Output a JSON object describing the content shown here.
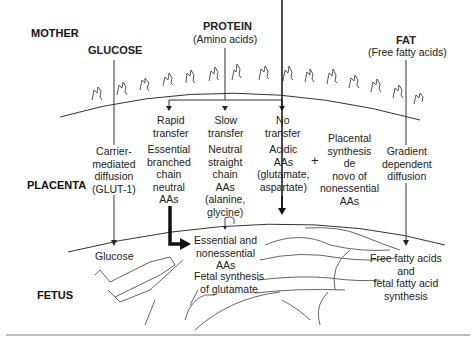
{
  "regions": {
    "mother": "MOTHER",
    "placenta": "PLACENTA",
    "fetus": "FETUS"
  },
  "nutrients": {
    "glucose": {
      "title": "GLUCOSE",
      "mechanism": "Carrier-\nmediated\ndiffusion\n(GLUT-1)",
      "fetal_result": "Glucose"
    },
    "protein": {
      "title": "PROTEIN",
      "subtitle": "(Amino acids)"
    },
    "fat": {
      "title": "FAT",
      "subtitle": "(Free fatty acids)",
      "mechanism": "Gradient\ndependent\ndiffusion",
      "fetal_result": "Free fatty acids\nand\nfetal fatty acid\nsynthesis"
    }
  },
  "amino_acid_pathways": [
    {
      "rate": "Rapid\ntransfer",
      "description": "Essential\nbranched\nchain\nneutral\nAAs"
    },
    {
      "rate": "Slow\ntransfer",
      "description": "Neutral\nstraight\nchain\nAAs\n(alanine,\nglycine)"
    },
    {
      "rate": "No\ntransfer",
      "description": "Acidic\nAAs\n(glutamate,\naspartate)"
    }
  ],
  "placental_synthesis": "Placental\nsynthesis\nde\nnovo of\nnonessential\nAAs",
  "plus_sign": "+",
  "fetal_amino_acids": "Essential and\nnonessential\nAAs",
  "fetal_glutamate": "Fetal synthesis\nof glutamate",
  "colors": {
    "line": "#333333",
    "text": "#222222",
    "background": "#ffffff"
  }
}
